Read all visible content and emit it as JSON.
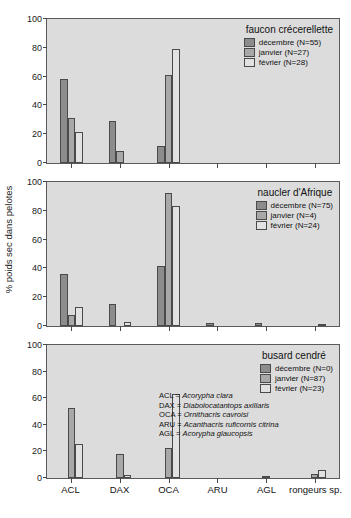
{
  "axis": {
    "ylabel": "% poids sec dans pelotes",
    "yticks": [
      "0",
      "20",
      "40",
      "60",
      "80",
      "100"
    ],
    "categories": [
      "ACL",
      "DAX",
      "OCA",
      "ARU",
      "AGL",
      "rongeurs sp."
    ]
  },
  "species_key": {
    "rows": [
      {
        "abbr": "ACL =",
        "name": "Acorypha clara"
      },
      {
        "abbr": "DAX =",
        "name": "Diabolocatantops axillaris"
      },
      {
        "abbr": "OCA =",
        "name": "Ornithacris cavroisi"
      },
      {
        "abbr": "ARU =",
        "name": "Acanthacris ruficornis citrina"
      },
      {
        "abbr": "AGL =",
        "name": "Acorypha glaucopsis"
      }
    ]
  },
  "colors": {
    "decembre": "#8c8c8c",
    "janvier": "#a8a8a8",
    "fevrier": "#e2e2e2",
    "panel_background": "#dcdcdc",
    "axis": "#4a4a4a"
  },
  "panels": [
    {
      "title": "faucon crécerellette",
      "legend": [
        "décembre (N=55)",
        "janvier (N=27)",
        "février (N=28)"
      ]
    },
    {
      "title": "naucler d'Afrique",
      "legend": [
        "décembre (N=75)",
        "janvier (N=4)",
        "février (N=24)"
      ]
    },
    {
      "title": "busard cendré",
      "legend": [
        "décembre (N=0)",
        "janvier (N=87)",
        "février (N=23)"
      ]
    }
  ],
  "chart_data": [
    {
      "type": "bar",
      "title": "faucon crécerellette",
      "xlabel": "",
      "ylabel": "% poids sec dans pelotes",
      "ylim": [
        0,
        100
      ],
      "grid": false,
      "legend_position": "top-right",
      "categories": [
        "ACL",
        "DAX",
        "OCA",
        "ARU",
        "AGL",
        "rongeurs sp."
      ],
      "series": [
        {
          "name": "décembre (N=55)",
          "values": [
            58,
            29.5,
            12,
            0,
            0,
            0
          ]
        },
        {
          "name": "janvier (N=27)",
          "values": [
            31,
            8,
            61,
            0,
            0,
            0
          ]
        },
        {
          "name": "février (N=28)",
          "values": [
            21.5,
            0,
            79,
            0,
            0,
            0
          ]
        }
      ]
    },
    {
      "type": "bar",
      "title": "naucler d'Afrique",
      "xlabel": "",
      "ylabel": "% poids sec dans pelotes",
      "ylim": [
        0,
        100
      ],
      "grid": false,
      "legend_position": "top-right",
      "categories": [
        "ACL",
        "DAX",
        "OCA",
        "ARU",
        "AGL",
        "rongeurs sp."
      ],
      "series": [
        {
          "name": "décembre (N=75)",
          "values": [
            36,
            15,
            41.5,
            2,
            2,
            0
          ]
        },
        {
          "name": "janvier (N=4)",
          "values": [
            7.5,
            0,
            92.5,
            0,
            0,
            0
          ]
        },
        {
          "name": "février (N=24)",
          "values": [
            13,
            3,
            83,
            0,
            0,
            1.5
          ]
        }
      ]
    },
    {
      "type": "bar",
      "title": "busard cendré",
      "xlabel": "",
      "ylabel": "% poids sec dans pelotes",
      "ylim": [
        0,
        100
      ],
      "grid": false,
      "legend_position": "top-right",
      "categories": [
        "ACL",
        "DAX",
        "OCA",
        "ARU",
        "AGL",
        "rongeurs sp."
      ],
      "series": [
        {
          "name": "décembre (N=0)",
          "values": [
            0,
            0,
            0,
            0,
            0,
            0
          ]
        },
        {
          "name": "janvier (N=87)",
          "values": [
            53,
            18,
            22.5,
            0,
            1,
            3
          ]
        },
        {
          "name": "février (N=23)",
          "values": [
            25.5,
            2,
            63.5,
            0,
            0,
            6
          ]
        }
      ]
    }
  ]
}
